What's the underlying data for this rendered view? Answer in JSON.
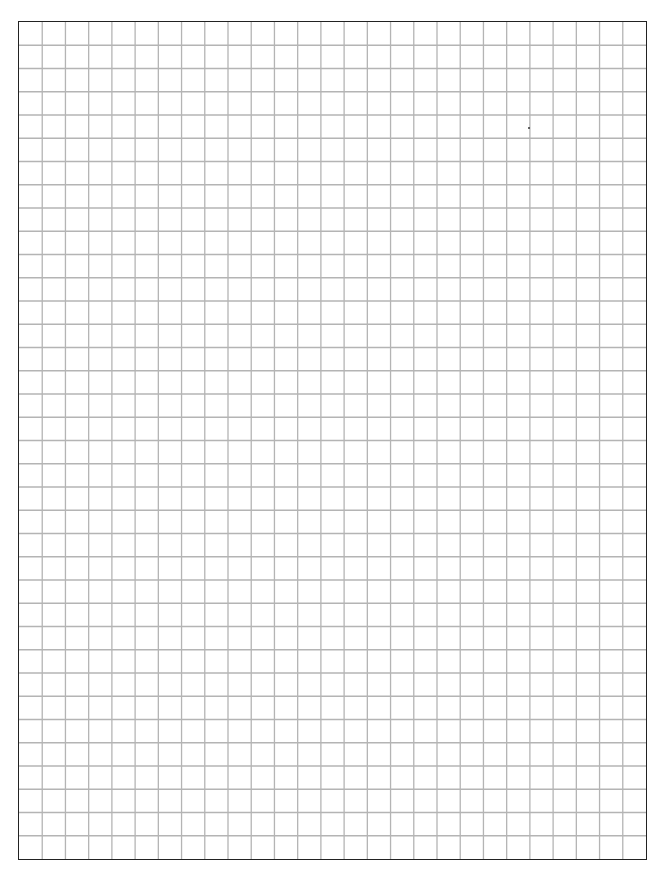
{
  "page": {
    "type": "graph-paper",
    "header_fragment": ""
  },
  "grid": {
    "columns": 27,
    "rows": 36,
    "line_color": "#b4b4b4",
    "border_color": "#222222",
    "background_color": "#ffffff"
  }
}
